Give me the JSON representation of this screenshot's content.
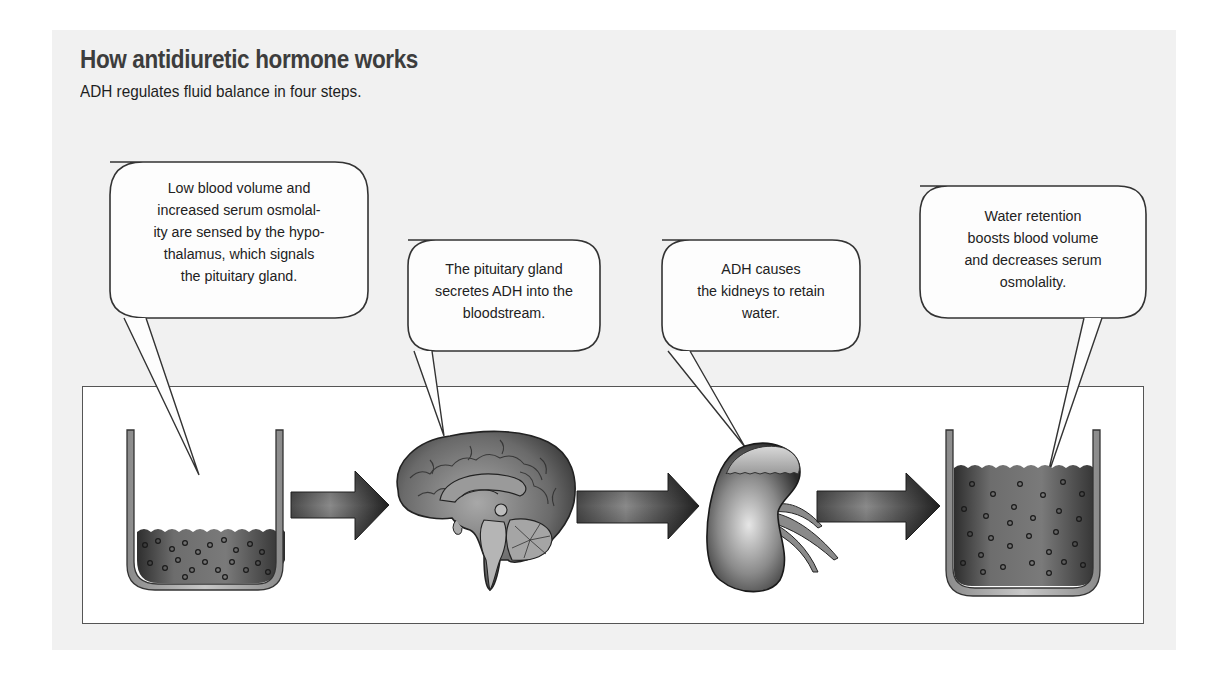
{
  "header": {
    "title": "How antidiuretic hormone works",
    "subtitle": "ADH regulates fluid balance in four steps."
  },
  "steps": [
    {
      "id": 1,
      "text": "Low blood volume and increased serum osmolal-ity are sensed by the hypo-thalamus, which signals the pituitary gland.",
      "lines": [
        "Low blood volume and",
        "increased serum osmolal-",
        "ity are sensed by the hypo-",
        "thalamus, which signals",
        "the pituitary gland."
      ],
      "points_to": "beaker-low-fluid"
    },
    {
      "id": 2,
      "text": "The pituitary gland secretes ADH into the bloodstream.",
      "lines": [
        "The pituitary gland",
        "secretes ADH into the",
        "bloodstream."
      ],
      "points_to": "brain"
    },
    {
      "id": 3,
      "text": "ADH causes the kidneys to retain water.",
      "lines": [
        "ADH causes",
        "the kidneys to retain",
        "water."
      ],
      "points_to": "kidney"
    },
    {
      "id": 4,
      "text": "Water retention boosts blood volume and decreases serum osmolality.",
      "lines": [
        "Water retention",
        "boosts blood volume",
        "and decreases serum",
        "osmolality."
      ],
      "points_to": "beaker-high-fluid"
    }
  ],
  "illustration": {
    "sequence": [
      "beaker-low-fluid-icon",
      "arrow-right-icon",
      "brain-icon",
      "arrow-right-icon",
      "kidney-icon",
      "arrow-right-icon",
      "beaker-high-fluid-icon"
    ]
  },
  "colors": {
    "panel_bg": "#f1f1f1",
    "stage_bg": "#ffffff",
    "outline": "#333333",
    "fluid": "#6b6b6b",
    "arrow": "#3a3a3a"
  }
}
